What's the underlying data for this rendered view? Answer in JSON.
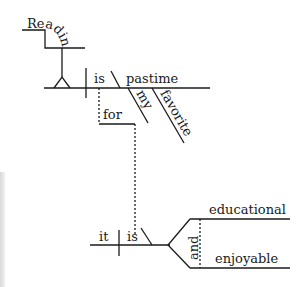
{
  "diagram": {
    "type": "sentence-diagram",
    "colors": {
      "line": "#1a1a1a",
      "text": "#1a1a1a",
      "background": "#ffffff"
    },
    "subject_clause": {
      "word": "Reading"
    },
    "main_clause": {
      "verb": "is",
      "predicate_noun": "pastime",
      "modifiers": [
        "my",
        "favorite"
      ]
    },
    "connector": {
      "word": "for"
    },
    "subordinate_clause": {
      "subject": "it",
      "verb": "is",
      "conjunction": "and",
      "complements": [
        "educational",
        "enjoyable"
      ]
    }
  }
}
